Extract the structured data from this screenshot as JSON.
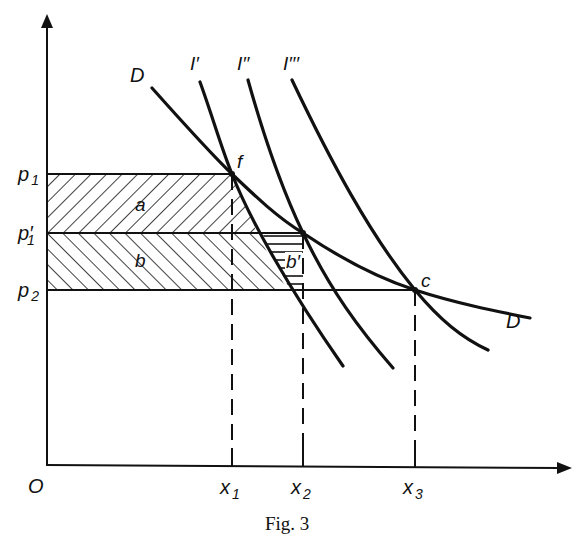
{
  "caption": "Fig. 3",
  "origin_label": "O",
  "y_labels": {
    "p1": "p",
    "p1_sub": "1",
    "p1prime": "p′",
    "p1prime_sub": "1",
    "p2": "p",
    "p2_sub": "2"
  },
  "x_labels": {
    "x1": "x",
    "x1_sub": "1",
    "x2": "x",
    "x2_sub": "2",
    "x3": "x",
    "x3_sub": "3"
  },
  "curve_labels": {
    "demand_top": "D",
    "demand_bottom": "D",
    "i1": "I′",
    "i2": "I′′",
    "i3": "I′′′"
  },
  "point_labels": {
    "f": "f",
    "c": "c"
  },
  "area_labels": {
    "a": "a",
    "b": "b",
    "b_prime": "b′"
  },
  "colors": {
    "ink": "#111111",
    "background": "#ffffff"
  }
}
